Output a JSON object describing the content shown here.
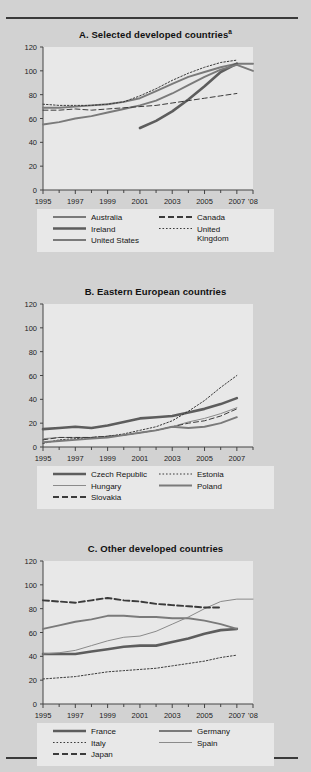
{
  "figure": {
    "background_color": "#d2d2d2",
    "plot_background_color": "#e8e8e8",
    "line_color": "#6b6b6b",
    "dark_line_color": "#4a4a4a",
    "axis_color": "#444444",
    "rule_color": "#3a3a3a"
  },
  "panels": [
    {
      "id": "A",
      "title": "A. Selected developed countries",
      "title_superscript": "a",
      "chart_data": {
        "type": "line",
        "title": "A. Selected developed countries",
        "xlabel": "",
        "ylabel": "",
        "ylim": [
          0,
          120
        ],
        "yticks": [
          0,
          20,
          40,
          60,
          80,
          100,
          120
        ],
        "xlim": [
          1995,
          2008
        ],
        "xticks": [
          1995,
          1997,
          1999,
          2001,
          2003,
          2005,
          2007,
          2008
        ],
        "xticklabels": [
          "1995",
          "1997",
          "1999",
          "2001",
          "2003",
          "2005",
          "2007",
          "'08"
        ],
        "grid": false,
        "legend_position": "below",
        "series": [
          {
            "name": "Australia",
            "style": "solid",
            "width": "medium",
            "x": [
              1995,
              1996,
              1997,
              1998,
              1999,
              2000,
              2001,
              2002,
              2003,
              2004,
              2005,
              2006,
              2007,
              2008
            ],
            "values": [
              69,
              69,
              70,
              71,
              72,
              74,
              77,
              83,
              89,
              95,
              99,
              103,
              106,
              106
            ]
          },
          {
            "name": "Ireland",
            "style": "solid",
            "width": "thick",
            "x": [
              2001,
              2002,
              2003,
              2004,
              2005,
              2006,
              2007
            ],
            "values": [
              52,
              58,
              66,
              76,
              87,
              99,
              106
            ]
          },
          {
            "name": "United States",
            "style": "solid",
            "width": "medium",
            "x": [
              1995,
              1996,
              1997,
              1998,
              1999,
              2000,
              2001,
              2002,
              2003,
              2004,
              2005,
              2006,
              2007,
              2008
            ],
            "values": [
              55,
              57,
              60,
              62,
              65,
              68,
              71,
              75,
              81,
              88,
              95,
              101,
              105,
              100
            ]
          },
          {
            "name": "Canada",
            "style": "dashed",
            "width": "thin",
            "x": [
              1995,
              1996,
              1997,
              1998,
              1999,
              2000,
              2001,
              2002,
              2003,
              2004,
              2005,
              2006,
              2007
            ],
            "values": [
              67,
              67,
              68,
              67,
              68,
              69,
              70,
              71,
              73,
              75,
              77,
              79,
              81
            ]
          },
          {
            "name": "United Kingdom",
            "style": "dotted",
            "width": "thin",
            "x": [
              1995,
              1996,
              1997,
              1998,
              1999,
              2000,
              2001,
              2002,
              2003,
              2004,
              2005,
              2006,
              2007
            ],
            "values": [
              72,
              71,
              71,
              71,
              72,
              74,
              79,
              85,
              92,
              98,
              103,
              107,
              109
            ]
          }
        ]
      },
      "legend": [
        {
          "label": "Australia",
          "style": "solid-medium"
        },
        {
          "label": "Canada",
          "style": "dashed"
        },
        {
          "label": "Ireland",
          "style": "solid-thick"
        },
        {
          "label": "United Kingdom",
          "style": "dotted"
        },
        {
          "label": "United States",
          "style": "solid-medium"
        }
      ]
    },
    {
      "id": "B",
      "title": "B. Eastern European countries",
      "title_superscript": "",
      "chart_data": {
        "type": "line",
        "title": "B. Eastern European countries",
        "xlabel": "",
        "ylabel": "",
        "ylim": [
          0,
          120
        ],
        "yticks": [
          0,
          20,
          40,
          60,
          80,
          100,
          120
        ],
        "xlim": [
          1995,
          2008
        ],
        "xticks": [
          1995,
          1997,
          1999,
          2001,
          2003,
          2005,
          2007
        ],
        "xticklabels": [
          "1995",
          "1997",
          "1999",
          "2001",
          "2003",
          "2005",
          "2007"
        ],
        "grid": false,
        "legend_position": "below",
        "series": [
          {
            "name": "Czech Republic",
            "style": "solid",
            "width": "thick",
            "x": [
              1995,
              1996,
              1997,
              1998,
              1999,
              2000,
              2001,
              2002,
              2003,
              2004,
              2005,
              2006,
              2007
            ],
            "values": [
              15,
              16,
              17,
              16,
              18,
              21,
              24,
              25,
              26,
              29,
              32,
              36,
              41
            ]
          },
          {
            "name": "Hungary",
            "style": "solid",
            "width": "thin",
            "x": [
              1995,
              1996,
              1997,
              1998,
              1999,
              2000,
              2001,
              2002,
              2003,
              2004,
              2005,
              2006,
              2007
            ],
            "values": [
              7,
              8,
              8,
              8,
              9,
              10,
              12,
              14,
              17,
              21,
              24,
              28,
              33
            ]
          },
          {
            "name": "Slovakia",
            "style": "dashed",
            "width": "thin",
            "x": [
              1995,
              1996,
              1997,
              1998,
              1999,
              2000,
              2001,
              2002,
              2003,
              2004,
              2005,
              2006,
              2007
            ],
            "values": [
              6,
              8,
              8,
              8,
              9,
              10,
              12,
              14,
              17,
              20,
              22,
              26,
              32
            ]
          },
          {
            "name": "Estonia",
            "style": "dotted",
            "width": "thin",
            "x": [
              1995,
              1996,
              1997,
              1998,
              1999,
              2000,
              2001,
              2002,
              2003,
              2004,
              2005,
              2006,
              2007
            ],
            "values": [
              3,
              6,
              7,
              8,
              9,
              11,
              14,
              17,
              22,
              30,
              39,
              50,
              60
            ]
          },
          {
            "name": "Poland",
            "style": "solid",
            "width": "medium",
            "x": [
              1995,
              1996,
              1997,
              1998,
              1999,
              2000,
              2001,
              2002,
              2003,
              2004,
              2005,
              2006,
              2007
            ],
            "values": [
              4,
              5,
              6,
              7,
              8,
              10,
              12,
              14,
              17,
              16,
              17,
              20,
              25
            ]
          }
        ]
      },
      "legend": [
        {
          "label": "Czech Republic",
          "style": "solid-thick"
        },
        {
          "label": "Estonia",
          "style": "dotted"
        },
        {
          "label": "Hungary",
          "style": "solid-thin"
        },
        {
          "label": "Poland",
          "style": "solid-medium"
        },
        {
          "label": "Slovakia",
          "style": "dashed"
        }
      ]
    },
    {
      "id": "C",
      "title": "C. Other developed countries",
      "title_superscript": "",
      "chart_data": {
        "type": "line",
        "title": "C. Other developed countries",
        "xlabel": "",
        "ylabel": "",
        "ylim": [
          0,
          120
        ],
        "yticks": [
          0,
          20,
          40,
          60,
          80,
          100,
          120
        ],
        "xlim": [
          1995,
          2008
        ],
        "xticks": [
          1995,
          1997,
          1999,
          2001,
          2003,
          2005,
          2007,
          2008
        ],
        "xticklabels": [
          "1995",
          "1997",
          "1999",
          "2001",
          "2003",
          "2005",
          "2007",
          "'08"
        ],
        "grid": false,
        "legend_position": "below",
        "series": [
          {
            "name": "France",
            "style": "solid",
            "width": "thick",
            "x": [
              1995,
              1996,
              1997,
              1998,
              1999,
              2000,
              2001,
              2002,
              2003,
              2004,
              2005,
              2006,
              2007
            ],
            "values": [
              42,
              42,
              42,
              44,
              46,
              48,
              49,
              49,
              52,
              55,
              59,
              62,
              63
            ]
          },
          {
            "name": "Germany",
            "style": "solid",
            "width": "medium",
            "x": [
              1995,
              1996,
              1997,
              1998,
              1999,
              2000,
              2001,
              2002,
              2003,
              2004,
              2005,
              2006,
              2007
            ],
            "values": [
              63,
              66,
              69,
              71,
              74,
              74,
              73,
              73,
              72,
              72,
              70,
              67,
              63
            ]
          },
          {
            "name": "Italy",
            "style": "dotted",
            "width": "thin",
            "x": [
              1995,
              1996,
              1997,
              1998,
              1999,
              2000,
              2001,
              2002,
              2003,
              2004,
              2005,
              2006,
              2007
            ],
            "values": [
              21,
              22,
              23,
              25,
              27,
              28,
              29,
              30,
              32,
              34,
              36,
              39,
              41
            ]
          },
          {
            "name": "Spain",
            "style": "solid",
            "width": "thin",
            "x": [
              1995,
              1996,
              1997,
              1998,
              1999,
              2000,
              2001,
              2002,
              2003,
              2004,
              2005,
              2006,
              2007,
              2008
            ],
            "values": [
              42,
              43,
              45,
              49,
              53,
              56,
              57,
              61,
              67,
              73,
              80,
              86,
              88,
              88
            ]
          },
          {
            "name": "Japan",
            "style": "dashed",
            "width": "medium",
            "x": [
              1995,
              1996,
              1997,
              1998,
              1999,
              2000,
              2001,
              2002,
              2003,
              2004,
              2005,
              2006
            ],
            "values": [
              87,
              86,
              85,
              87,
              89,
              87,
              86,
              84,
              83,
              82,
              81,
              81
            ]
          }
        ]
      },
      "legend": [
        {
          "label": "France",
          "style": "solid-thick"
        },
        {
          "label": "Germany",
          "style": "solid-medium"
        },
        {
          "label": "Italy",
          "style": "dotted"
        },
        {
          "label": "Spain",
          "style": "solid-thin"
        },
        {
          "label": "Japan",
          "style": "dashed"
        }
      ]
    }
  ]
}
